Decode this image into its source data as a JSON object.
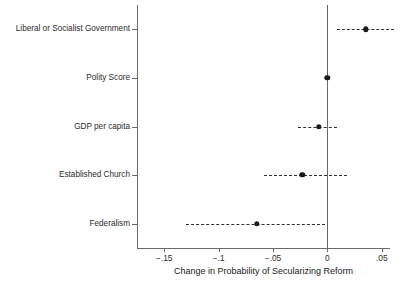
{
  "chart_data": {
    "type": "scatter",
    "title": "",
    "xlabel": "Change in Probability of Secularizing Reform",
    "ylabel": "",
    "xlim": [
      -0.175,
      0.0575
    ],
    "grid": false,
    "legend": null,
    "orientation": "horizontal",
    "zero_reference_line": 0,
    "xticks": [
      -0.15,
      -0.1,
      -0.05,
      0,
      0.05
    ],
    "xticklabels": [
      "−.15",
      "−.1",
      "−.05",
      "0",
      ".05"
    ],
    "categories": [
      "Liberal or Socialist Government",
      "Polity Score",
      "GDP per capita",
      "Established Church",
      "Federalism"
    ],
    "points": [
      {
        "label": "Liberal or Socialist Government",
        "estimate": 0.035,
        "ci_low": 0.009,
        "ci_high": 0.061
      },
      {
        "label": "Polity Score",
        "estimate": 0.0,
        "ci_low": -0.001,
        "ci_high": 0.001
      },
      {
        "label": "GDP per capita",
        "estimate": -0.008,
        "ci_low": -0.027,
        "ci_high": 0.009
      },
      {
        "label": "Established Church",
        "estimate": -0.023,
        "ci_low": -0.058,
        "ci_high": 0.018
      },
      {
        "label": "Federalism",
        "estimate": -0.065,
        "ci_low": -0.13,
        "ci_high": -0.002
      }
    ],
    "colors": {
      "point": "#1a1a1a",
      "ci": "#2f2f2f",
      "axis": "#6a6a6a",
      "text": "#2b2b2b",
      "background": "#ffffff"
    }
  }
}
